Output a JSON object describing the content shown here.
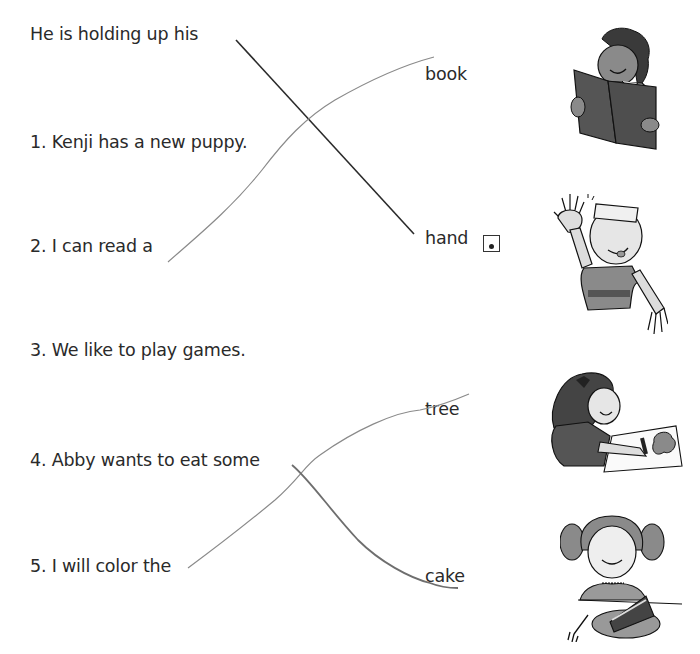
{
  "worksheet": {
    "example": {
      "sentence": "He is holding up his",
      "answer": "hand"
    },
    "sentences": [
      {
        "number": "1.",
        "text": "1. Kenji has a new puppy."
      },
      {
        "number": "2.",
        "text": "2. I can read a"
      },
      {
        "number": "3.",
        "text": "3. We like to play games."
      },
      {
        "number": "4.",
        "text": "4. Abby wants to eat some"
      },
      {
        "number": "5.",
        "text": "5. I will color the"
      }
    ],
    "words": [
      {
        "label": "book"
      },
      {
        "label": "hand"
      },
      {
        "label": "tree"
      },
      {
        "label": "cake"
      }
    ],
    "pictures": [
      {
        "name": "boy-reading-book"
      },
      {
        "name": "boy-waving-hand"
      },
      {
        "name": "girl-coloring-tree"
      },
      {
        "name": "girl-eating-cake"
      }
    ],
    "matches_drawn": [
      {
        "from": "He is holding up his",
        "to": "hand",
        "color": "#2a2a2a"
      },
      {
        "from": "2. I can read a",
        "to": "book",
        "color": "#8a8a8a"
      },
      {
        "from": "5. I will color the",
        "to": "tree",
        "color": "#8a8a8a"
      },
      {
        "from": "4. Abby wants to eat some",
        "to": "cake",
        "color": "#6e6e6e"
      }
    ]
  }
}
